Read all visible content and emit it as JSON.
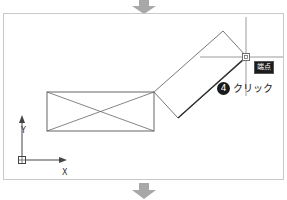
{
  "figure": {
    "type": "cad-drawing-step-illustration",
    "flow_arrow_top": {
      "icon": "arrow-down-icon",
      "color": "#a8a8a8"
    },
    "flow_arrow_bottom": {
      "icon": "arrow-down-icon",
      "color": "#a8a8a8"
    }
  },
  "viewport": {
    "border_color": "#c9c9c9",
    "background": "#ffffff",
    "geometry_color": "#555555",
    "highlight_color": "#2b2b2b"
  },
  "snap_tooltip": {
    "label": "端点",
    "background": "#1c1c1c",
    "text_color": "#ffffff"
  },
  "cursor": {
    "name": "crosshair-cursor",
    "x": 245,
    "y": 56,
    "snap_marker": "square",
    "color": "#8a8a8a"
  },
  "step_callout": {
    "number": "4",
    "label": "クリック",
    "badge_color": "#1a1a1a",
    "text_color": "#1a1a1a"
  },
  "ucs_icon": {
    "x_label": "X",
    "y_label": "Y",
    "origin_marker": "square",
    "color": "#333333"
  },
  "shapes": {
    "rectangle": {
      "name": "base-rectangle-with-diagonals",
      "points": "45,91 152,91 152,130 45,130",
      "diagonals": true
    },
    "rotated_rectangle": {
      "name": "rotated-rectangle",
      "points": "152,91 222,30 246,56 176,117"
    },
    "highlight_edge": {
      "name": "highlighted-diagonal-edge",
      "from": "176,117",
      "to": "245,56"
    }
  }
}
